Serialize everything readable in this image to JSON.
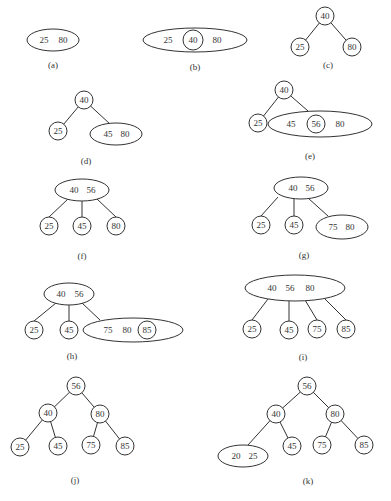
{
  "panels": [
    {
      "label": "(a)",
      "caption_pos": [
        53,
        68
      ],
      "nodes": [
        {
          "type": "ellipse",
          "cx": 53,
          "cy": 40,
          "rx": 26,
          "ry": 11,
          "keys": [
            "25",
            "80"
          ],
          "key_x": [
            44,
            63
          ]
        }
      ],
      "edges": []
    },
    {
      "label": "(b)",
      "caption_pos": [
        195,
        70
      ],
      "nodes": [
        {
          "type": "ellipse",
          "cx": 195,
          "cy": 40,
          "rx": 52,
          "ry": 12,
          "keys": [
            "25",
            "80"
          ],
          "key_x": [
            168,
            217
          ]
        },
        {
          "type": "circle",
          "cx": 193,
          "cy": 40,
          "r": 10,
          "keys": [
            "40"
          ],
          "key_x": [
            193
          ]
        }
      ],
      "edges": []
    },
    {
      "label": "(c)",
      "caption_pos": [
        328,
        68
      ],
      "nodes": [
        {
          "type": "circle",
          "cx": 325,
          "cy": 16,
          "r": 9,
          "keys": [
            "40"
          ],
          "key_x": [
            325
          ]
        },
        {
          "type": "circle",
          "cx": 300,
          "cy": 47,
          "r": 9,
          "keys": [
            "25"
          ],
          "key_x": [
            300
          ]
        },
        {
          "type": "circle",
          "cx": 352,
          "cy": 47,
          "r": 9,
          "keys": [
            "80"
          ],
          "key_x": [
            352
          ]
        }
      ],
      "edges": [
        [
          325,
          16,
          300,
          47
        ],
        [
          325,
          16,
          352,
          47
        ]
      ]
    },
    {
      "label": "(d)",
      "caption_pos": [
        86,
        164
      ],
      "nodes": [
        {
          "type": "circle",
          "cx": 84,
          "cy": 100,
          "r": 9,
          "keys": [
            "40"
          ],
          "key_x": [
            84
          ]
        },
        {
          "type": "circle",
          "cx": 58,
          "cy": 131,
          "r": 9,
          "keys": [
            "25"
          ],
          "key_x": [
            58
          ]
        },
        {
          "type": "ellipse",
          "cx": 116,
          "cy": 134,
          "rx": 26,
          "ry": 11,
          "keys": [
            "45",
            "80"
          ],
          "key_x": [
            108,
            125
          ]
        }
      ],
      "edges": [
        [
          84,
          100,
          58,
          131
        ],
        [
          84,
          100,
          110,
          124
        ]
      ]
    },
    {
      "label": "(e)",
      "caption_pos": [
        310,
        159
      ],
      "nodes": [
        {
          "type": "circle",
          "cx": 284,
          "cy": 90,
          "r": 9,
          "keys": [
            "40"
          ],
          "key_x": [
            284
          ]
        },
        {
          "type": "circle",
          "cx": 258,
          "cy": 123,
          "r": 9,
          "keys": [
            "25"
          ],
          "key_x": [
            258
          ]
        },
        {
          "type": "ellipse",
          "cx": 320,
          "cy": 124,
          "rx": 52,
          "ry": 13,
          "keys": [
            "45",
            "80"
          ],
          "key_x": [
            291,
            340
          ]
        },
        {
          "type": "circle",
          "cx": 316,
          "cy": 124,
          "r": 9,
          "keys": [
            "56"
          ],
          "key_x": [
            316
          ]
        }
      ],
      "edges": [
        [
          284,
          90,
          258,
          123
        ],
        [
          284,
          90,
          308,
          111
        ]
      ]
    },
    {
      "label": "(f)",
      "caption_pos": [
        82,
        259
      ],
      "nodes": [
        {
          "type": "ellipse",
          "cx": 82,
          "cy": 190,
          "rx": 27,
          "ry": 11,
          "keys": [
            "40",
            "56"
          ],
          "key_x": [
            74,
            91
          ]
        },
        {
          "type": "circle",
          "cx": 49,
          "cy": 226,
          "r": 9,
          "keys": [
            "25"
          ],
          "key_x": [
            49
          ]
        },
        {
          "type": "circle",
          "cx": 82,
          "cy": 226,
          "r": 9,
          "keys": [
            "45"
          ],
          "key_x": [
            82
          ]
        },
        {
          "type": "circle",
          "cx": 116,
          "cy": 226,
          "r": 9,
          "keys": [
            "80"
          ],
          "key_x": [
            116
          ]
        }
      ],
      "edges": [
        [
          68,
          199,
          49,
          217
        ],
        [
          82,
          201,
          82,
          217
        ],
        [
          97,
          199,
          116,
          217
        ]
      ]
    },
    {
      "label": "(g)",
      "caption_pos": [
        304,
        258
      ],
      "nodes": [
        {
          "type": "ellipse",
          "cx": 301,
          "cy": 188,
          "rx": 27,
          "ry": 11,
          "keys": [
            "40",
            "56"
          ],
          "key_x": [
            293,
            310
          ]
        },
        {
          "type": "circle",
          "cx": 261,
          "cy": 225,
          "r": 9,
          "keys": [
            "25"
          ],
          "key_x": [
            261
          ]
        },
        {
          "type": "circle",
          "cx": 294,
          "cy": 225,
          "r": 9,
          "keys": [
            "45"
          ],
          "key_x": [
            294
          ]
        },
        {
          "type": "ellipse",
          "cx": 342,
          "cy": 227,
          "rx": 26,
          "ry": 12,
          "keys": [
            "75",
            "80"
          ],
          "key_x": [
            333,
            350
          ]
        }
      ],
      "edges": [
        [
          278,
          197,
          261,
          216
        ],
        [
          294,
          199,
          294,
          216
        ],
        [
          308,
          198,
          328,
          216
        ]
      ]
    },
    {
      "label": "(h)",
      "caption_pos": [
        72,
        359
      ],
      "nodes": [
        {
          "type": "ellipse",
          "cx": 69,
          "cy": 294,
          "rx": 25,
          "ry": 11,
          "keys": [
            "40",
            "56"
          ],
          "key_x": [
            61,
            79
          ]
        },
        {
          "type": "circle",
          "cx": 34,
          "cy": 330,
          "r": 9,
          "keys": [
            "25"
          ],
          "key_x": [
            34
          ]
        },
        {
          "type": "circle",
          "cx": 69,
          "cy": 330,
          "r": 9,
          "keys": [
            "45"
          ],
          "key_x": [
            69
          ]
        },
        {
          "type": "ellipse",
          "cx": 133,
          "cy": 330,
          "rx": 50,
          "ry": 12,
          "keys": [
            "75",
            "80"
          ],
          "key_x": [
            108,
            127
          ]
        },
        {
          "type": "circle",
          "cx": 147,
          "cy": 330,
          "r": 9,
          "keys": [
            "85"
          ],
          "key_x": [
            147
          ]
        }
      ],
      "edges": [
        [
          56,
          303,
          34,
          321
        ],
        [
          69,
          305,
          69,
          321
        ],
        [
          82,
          303,
          100,
          320
        ]
      ]
    },
    {
      "label": "(i)",
      "caption_pos": [
        303,
        360
      ],
      "nodes": [
        {
          "type": "ellipse",
          "cx": 295,
          "cy": 288,
          "rx": 50,
          "ry": 13,
          "keys": [
            "40",
            "56",
            "80"
          ],
          "key_x": [
            272,
            290,
            310
          ]
        },
        {
          "type": "circle",
          "cx": 252,
          "cy": 329,
          "r": 9,
          "keys": [
            "25"
          ],
          "key_x": [
            252
          ]
        },
        {
          "type": "circle",
          "cx": 289,
          "cy": 330,
          "r": 9,
          "keys": [
            "45"
          ],
          "key_x": [
            289
          ]
        },
        {
          "type": "circle",
          "cx": 317,
          "cy": 329,
          "r": 9,
          "keys": [
            "75"
          ],
          "key_x": [
            317
          ]
        },
        {
          "type": "circle",
          "cx": 346,
          "cy": 329,
          "r": 9,
          "keys": [
            "85"
          ],
          "key_x": [
            346
          ]
        }
      ],
      "edges": [
        [
          268,
          299,
          252,
          320
        ],
        [
          289,
          301,
          289,
          321
        ],
        [
          305,
          300,
          317,
          320
        ],
        [
          324,
          298,
          346,
          320
        ]
      ]
    },
    {
      "label": "(j)",
      "caption_pos": [
        75,
        483
      ],
      "nodes": [
        {
          "type": "circle",
          "cx": 76,
          "cy": 386,
          "r": 9,
          "keys": [
            "56"
          ],
          "key_x": [
            76
          ]
        },
        {
          "type": "circle",
          "cx": 48,
          "cy": 413,
          "r": 9,
          "keys": [
            "40"
          ],
          "key_x": [
            48
          ]
        },
        {
          "type": "circle",
          "cx": 100,
          "cy": 414,
          "r": 9,
          "keys": [
            "80"
          ],
          "key_x": [
            100
          ]
        },
        {
          "type": "circle",
          "cx": 20,
          "cy": 447,
          "r": 9,
          "keys": [
            "25"
          ],
          "key_x": [
            20
          ]
        },
        {
          "type": "circle",
          "cx": 58,
          "cy": 446,
          "r": 9,
          "keys": [
            "45"
          ],
          "key_x": [
            58
          ]
        },
        {
          "type": "circle",
          "cx": 91,
          "cy": 445,
          "r": 9,
          "keys": [
            "75"
          ],
          "key_x": [
            91
          ]
        },
        {
          "type": "circle",
          "cx": 125,
          "cy": 446,
          "r": 9,
          "keys": [
            "85"
          ],
          "key_x": [
            125
          ]
        }
      ],
      "edges": [
        [
          76,
          386,
          48,
          413
        ],
        [
          76,
          386,
          100,
          414
        ],
        [
          48,
          413,
          20,
          447
        ],
        [
          48,
          413,
          58,
          446
        ],
        [
          100,
          414,
          91,
          445
        ],
        [
          100,
          414,
          125,
          446
        ]
      ]
    },
    {
      "label": "(k)",
      "caption_pos": [
        308,
        484
      ],
      "nodes": [
        {
          "type": "circle",
          "cx": 307,
          "cy": 386,
          "r": 9,
          "keys": [
            "56"
          ],
          "key_x": [
            307
          ]
        },
        {
          "type": "circle",
          "cx": 276,
          "cy": 414,
          "r": 9,
          "keys": [
            "40"
          ],
          "key_x": [
            276
          ]
        },
        {
          "type": "circle",
          "cx": 335,
          "cy": 414,
          "r": 9,
          "keys": [
            "80"
          ],
          "key_x": [
            335
          ]
        },
        {
          "type": "ellipse",
          "cx": 243,
          "cy": 456,
          "rx": 25,
          "ry": 11,
          "keys": [
            "20",
            "25"
          ],
          "key_x": [
            236,
            253
          ]
        },
        {
          "type": "circle",
          "cx": 292,
          "cy": 446,
          "r": 9,
          "keys": [
            "45"
          ],
          "key_x": [
            292
          ]
        },
        {
          "type": "circle",
          "cx": 322,
          "cy": 445,
          "r": 9,
          "keys": [
            "75"
          ],
          "key_x": [
            322
          ]
        },
        {
          "type": "circle",
          "cx": 364,
          "cy": 445,
          "r": 9,
          "keys": [
            "85"
          ],
          "key_x": [
            364
          ]
        }
      ],
      "edges": [
        [
          307,
          386,
          276,
          414
        ],
        [
          307,
          386,
          335,
          414
        ],
        [
          276,
          414,
          248,
          445
        ],
        [
          276,
          414,
          292,
          446
        ],
        [
          335,
          414,
          322,
          445
        ],
        [
          335,
          414,
          364,
          445
        ]
      ]
    }
  ]
}
